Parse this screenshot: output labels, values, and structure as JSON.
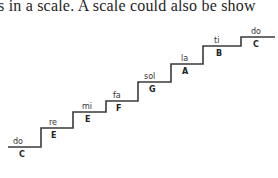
{
  "text": {
    "line": "s in a scale. A scale could also be show"
  },
  "figure": {
    "type": "staircase-scale-diagram",
    "line_color": "#3a3a3a",
    "steps": [
      {
        "syllable": "do",
        "note": "C"
      },
      {
        "syllable": "re",
        "note": "D"
      },
      {
        "syllable": "mi",
        "note": "E"
      },
      {
        "syllable": "fa",
        "note": "F"
      },
      {
        "syllable": "sol",
        "note": "G"
      },
      {
        "syllable": "la",
        "note": "A"
      },
      {
        "syllable": "ti",
        "note": "B"
      },
      {
        "syllable": "do",
        "note": "C"
      }
    ]
  }
}
